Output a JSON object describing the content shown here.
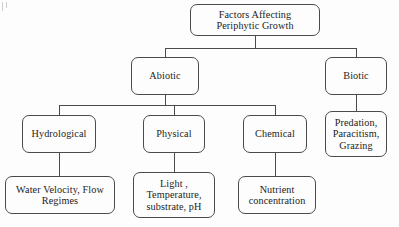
{
  "diagram": {
    "title": "Factors Affecting Periphytic Growth",
    "type": "hierarchy-tree",
    "orientation": "top-down",
    "levels": 4,
    "node_shape": "rounded-rectangle",
    "colors": {
      "background": "#fdfdfd",
      "node_fill": "#fdfdfd",
      "node_border": "#4b4b4b",
      "connector": "#4b4b4b",
      "text": "#1c1c1c"
    },
    "nodes": {
      "root": {
        "id": "root",
        "label": "Factors Affecting\nPeriphytic Growth",
        "level": 1
      },
      "abiotic": {
        "id": "abiotic",
        "label": "Abiotic",
        "level": 2,
        "parent": "root"
      },
      "biotic": {
        "id": "biotic",
        "label": "Biotic",
        "level": 2,
        "parent": "root"
      },
      "hydrological": {
        "id": "hydrological",
        "label": "Hydrological",
        "level": 3,
        "parent": "abiotic"
      },
      "physical": {
        "id": "physical",
        "label": "Physical",
        "level": 3,
        "parent": "abiotic"
      },
      "chemical": {
        "id": "chemical",
        "label": "Chemical",
        "level": 3,
        "parent": "abiotic"
      },
      "biotic_children": {
        "id": "biotic_children",
        "label": "Predation,\nParacitism,\nGrazing",
        "level": 3,
        "parent": "biotic"
      },
      "water_velocity": {
        "id": "water_velocity",
        "label": "Water Velocity, Flow\nRegimes",
        "level": 4,
        "parent": "hydrological"
      },
      "light_temp": {
        "id": "light_temp",
        "label": "Light ,\nTemperature,\nsubstrate, pH",
        "level": 4,
        "parent": "physical"
      },
      "nutrient": {
        "id": "nutrient",
        "label": "Nutrient\nconcentration",
        "level": 4,
        "parent": "chemical"
      }
    },
    "edges": [
      {
        "from": "root",
        "to": "abiotic"
      },
      {
        "from": "root",
        "to": "biotic"
      },
      {
        "from": "abiotic",
        "to": "hydrological"
      },
      {
        "from": "abiotic",
        "to": "physical"
      },
      {
        "from": "abiotic",
        "to": "chemical"
      },
      {
        "from": "biotic",
        "to": "biotic_children"
      },
      {
        "from": "hydrological",
        "to": "water_velocity"
      },
      {
        "from": "physical",
        "to": "light_temp"
      },
      {
        "from": "chemical",
        "to": "nutrient"
      }
    ]
  }
}
